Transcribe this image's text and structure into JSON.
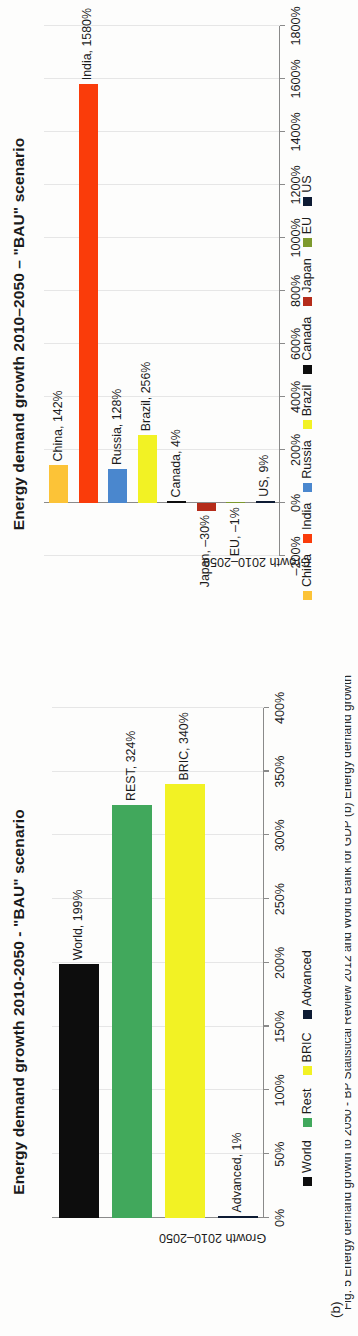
{
  "figure": {
    "label": "(b)",
    "caption": "Fig. 5 Energy demand growth to 2050 - BP Statistical Review 2012 and World Bank for GDP (b) Energy demand growth"
  },
  "panel_a": {
    "title": "Energy demand growth 2010-2050 - \"BAU\" scenario",
    "y_axis_label": "Growth 2010–2050",
    "legend": [
      {
        "label": "World",
        "color": "#0d0d0d"
      },
      {
        "label": "Rest",
        "color": "#41a85c"
      },
      {
        "label": "BRIC",
        "color": "#f2f224"
      },
      {
        "label": "Advanced",
        "color": "#0d1b33"
      }
    ],
    "chart_data": {
      "type": "bar",
      "title": "Energy demand growth 2010-2050 - \"BAU\" scenario",
      "xlabel": "",
      "ylabel": "Growth 2010–2050",
      "categories": [
        "World",
        "Rest",
        "BRIC",
        "Advanced"
      ],
      "values": [
        199,
        324,
        340,
        1
      ],
      "value_labels": [
        "World, 199%",
        "REST, 324%",
        "BRIC, 340%",
        "Advanced, 1%"
      ],
      "colors": [
        "#0d0d0d",
        "#41a85c",
        "#f2f224",
        "#0d1b33"
      ],
      "ylim": [
        0,
        400
      ],
      "ticks": [
        "0%",
        "50%",
        "100%",
        "150%",
        "200%",
        "250%",
        "300%",
        "350%",
        "400%"
      ],
      "tick_values": [
        0,
        50,
        100,
        150,
        200,
        250,
        300,
        350,
        400
      ],
      "grid": true,
      "orientation": "vertical",
      "legend_position": "bottom"
    }
  },
  "panel_b": {
    "title": "Energy demand growth 2010–2050 – \"BAU\" scenario",
    "y_axis_label": "Growth 2010–2050",
    "legend": [
      {
        "label": "China",
        "color": "#fcc337"
      },
      {
        "label": "India",
        "color": "#fa3c0a"
      },
      {
        "label": "Russia",
        "color": "#4a87ce"
      },
      {
        "label": "Brazil",
        "color": "#f2f224"
      },
      {
        "label": "Canada",
        "color": "#0d0d0d"
      },
      {
        "label": "Japan",
        "color": "#b52c1a"
      },
      {
        "label": "EU",
        "color": "#7d9a2e"
      },
      {
        "label": "US",
        "color": "#0d1b33"
      }
    ],
    "chart_data": {
      "type": "bar",
      "title": "Energy demand growth 2010–2050 – \"BAU\" scenario",
      "xlabel": "",
      "ylabel": "Growth 2010–2050",
      "categories": [
        "China",
        "India",
        "Russia",
        "Brazil",
        "Canada",
        "Japan",
        "EU",
        "US"
      ],
      "values": [
        142,
        1580,
        128,
        256,
        4,
        -30,
        -1,
        9
      ],
      "value_labels": [
        "China, 142%",
        "India, 1580%",
        "Russia, 128%",
        "Brazil, 256%",
        "Canada, 4%",
        "Japan, –30%",
        "EU, –1%",
        "US, 9%"
      ],
      "colors": [
        "#fcc337",
        "#fa3c0a",
        "#4a87ce",
        "#f2f224",
        "#0d0d0d",
        "#b52c1a",
        "#7d9a2e",
        "#0d1b33"
      ],
      "ylim": [
        -200,
        1800
      ],
      "ticks": [
        "–200%",
        "0%",
        "200%",
        "400%",
        "600%",
        "800%",
        "1000%",
        "1200%",
        "1400%",
        "1600%",
        "1800%"
      ],
      "tick_values": [
        -200,
        0,
        200,
        400,
        600,
        800,
        1000,
        1200,
        1400,
        1600,
        1800
      ],
      "grid": true,
      "orientation": "vertical",
      "legend_position": "bottom"
    }
  }
}
